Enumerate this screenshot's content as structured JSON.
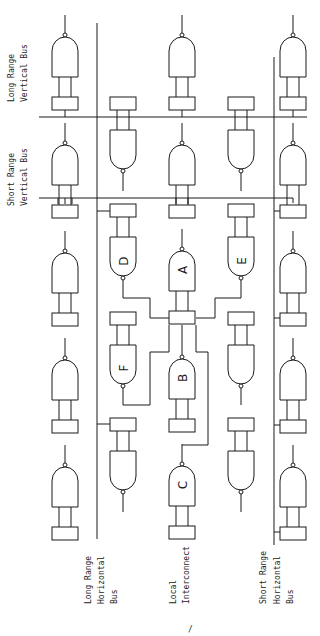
{
  "diagram": {
    "title": "",
    "colors": {
      "line": "#1a1a1a",
      "background": "#ffffff",
      "label": "#222222"
    },
    "labels": {
      "long_range_vertical": [
        "Long Range",
        "Vertical Bus"
      ],
      "short_range_vertical": [
        "Short Range",
        "Vertical Bus"
      ],
      "long_range_horizontal": [
        "Long Range",
        "Horizontal",
        "Bus"
      ],
      "local_interconnect": [
        "Local",
        "Interconnect"
      ],
      "short_range_horizontal": [
        "Short Range",
        "Horizontal",
        "Bus"
      ]
    },
    "gate_letters": {
      "A": "A",
      "B": "B",
      "C": "C",
      "D": "D",
      "E": "E",
      "F": "F"
    },
    "columns_x": [
      65,
      123,
      182,
      241,
      293
    ],
    "buses": {
      "long_range_vertical_y": 117,
      "short_range_vertical_y": 198,
      "long_range_horizontal_x": 97,
      "short_range_horizontal_x": 274
    },
    "footer_mark": "/"
  }
}
